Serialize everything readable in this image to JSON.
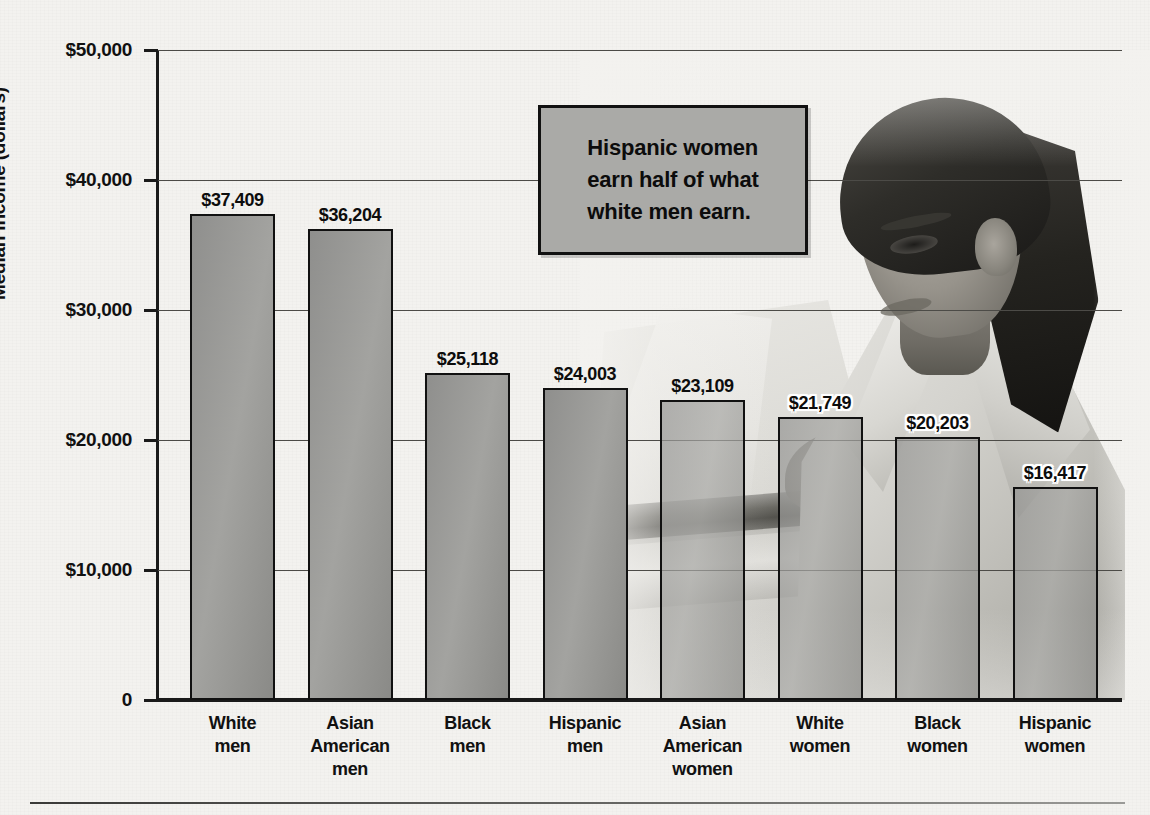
{
  "figure": {
    "background_color": "#f3f2ef",
    "callout": {
      "text": "Hispanic women earn half of what white men earn.",
      "line1": "Hispanic women",
      "line2": "earn half of what",
      "line3": "white men earn.",
      "fill_color": "#aaaaa7",
      "border_color": "#111111"
    },
    "photo": {
      "description": "Grayscale photograph of a woman with a ponytail wearing a light blazer, working at a laptop on a desk",
      "alt": "woman-at-laptop-photo"
    }
  },
  "chart_data": {
    "type": "bar",
    "title": "",
    "xlabel": "",
    "ylabel": "Median income (dollars)",
    "ylim": [
      0,
      50000
    ],
    "grid": true,
    "legend": null,
    "ytick_labels": [
      "$50,000",
      "$40,000",
      "$30,000",
      "$20,000",
      "$10,000",
      "0"
    ],
    "ytick_values": [
      50000,
      40000,
      30000,
      20000,
      10000,
      0
    ],
    "categories": [
      "White men",
      "Asian American men",
      "Black men",
      "Hispanic men",
      "Asian American women",
      "White women",
      "Black women",
      "Hispanic women"
    ],
    "category_lines": [
      [
        "White",
        "men"
      ],
      [
        "Asian",
        "American",
        "men"
      ],
      [
        "Black",
        "men"
      ],
      [
        "Hispanic",
        "men"
      ],
      [
        "Asian",
        "American",
        "women"
      ],
      [
        "White",
        "women"
      ],
      [
        "Black",
        "women"
      ],
      [
        "Hispanic",
        "women"
      ]
    ],
    "values": [
      37409,
      36204,
      25118,
      24003,
      23109,
      21749,
      20203,
      16417
    ],
    "value_labels": [
      "$37,409",
      "$36,204",
      "$25,118",
      "$24,003",
      "$23,109",
      "$21,749",
      "$20,203",
      "$16,417"
    ],
    "bar_color": "#9a9a97",
    "bar_edge_color": "#111111"
  }
}
